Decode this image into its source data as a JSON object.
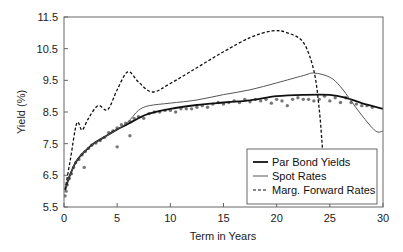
{
  "chart_data": {
    "type": "line",
    "title": "",
    "xlabel": "Term in Years",
    "ylabel": "Yield (%)",
    "xlim": [
      0,
      30
    ],
    "ylim": [
      5.5,
      11.5
    ],
    "xticks": [
      0,
      5,
      10,
      15,
      20,
      25,
      30
    ],
    "yticks": [
      5.5,
      6.5,
      7.5,
      8.5,
      9.5,
      10.5,
      11.5
    ],
    "ytick_labels": [
      "5.5",
      "6.5",
      "7.5",
      "8.5",
      "9.5",
      "10.5",
      "11.5"
    ],
    "xtick_labels": [
      "0",
      "5",
      "10",
      "15",
      "20",
      "25",
      "30"
    ],
    "grid": false,
    "legend_position": "lower right",
    "series": [
      {
        "name": "Par Bond Yields",
        "style": "solid-thick",
        "color": "#111111",
        "x": [
          0.1,
          0.5,
          1.0,
          1.5,
          2.3,
          3.0,
          4.0,
          5.0,
          6.0,
          7.0,
          8.0,
          10.0,
          12.5,
          15.0,
          17.5,
          20.0,
          22.5,
          25.0,
          26.5,
          28.0,
          30.0
        ],
        "y": [
          6.04,
          6.45,
          6.85,
          7.1,
          7.37,
          7.55,
          7.75,
          7.95,
          8.12,
          8.3,
          8.45,
          8.6,
          8.72,
          8.8,
          8.87,
          9.0,
          9.04,
          9.04,
          8.95,
          8.78,
          8.6
        ]
      },
      {
        "name": "Spot Rates",
        "style": "solid-thin",
        "color": "#555555",
        "x": [
          0.1,
          0.5,
          1.0,
          1.5,
          2.3,
          3.0,
          4.0,
          5.0,
          6.0,
          7.0,
          8.0,
          10.0,
          12.5,
          15.0,
          17.5,
          20.0,
          22.5,
          23.5,
          25.0,
          26.0,
          27.0,
          28.0,
          29.3,
          30.0
        ],
        "y": [
          6.04,
          6.45,
          6.85,
          7.1,
          7.37,
          7.55,
          7.75,
          7.95,
          8.18,
          8.55,
          8.7,
          8.78,
          8.88,
          9.05,
          9.2,
          9.42,
          9.65,
          9.73,
          9.6,
          9.3,
          8.85,
          8.4,
          7.9,
          7.9
        ]
      },
      {
        "name": "Marg. Forward Rates",
        "style": "dashed",
        "color": "#111111",
        "x": [
          0.1,
          0.6,
          1.2,
          1.7,
          2.3,
          3.2,
          4.1,
          5.0,
          6.0,
          7.0,
          8.3,
          10.0,
          12.5,
          15.0,
          17.5,
          19.6,
          21.0,
          22.5,
          23.5,
          24.0,
          24.3
        ],
        "y": [
          6.04,
          7.0,
          8.15,
          7.93,
          8.3,
          8.7,
          8.57,
          9.2,
          9.77,
          9.45,
          9.13,
          9.4,
          9.9,
          10.4,
          10.85,
          11.06,
          11.0,
          10.7,
          9.8,
          8.6,
          7.37
        ]
      },
      {
        "name": "Observed Par Yields (markers)",
        "style": "markers",
        "color": "#777777",
        "x": [
          0.1,
          0.2,
          0.3,
          0.5,
          0.7,
          0.9,
          1.1,
          1.4,
          1.7,
          2.0,
          2.3,
          2.6,
          3.0,
          3.4,
          3.8,
          4.2,
          4.6,
          5.0,
          5.4,
          5.8,
          6.2,
          6.6,
          7.0,
          7.5,
          8.0,
          8.5,
          9.0,
          9.5,
          10.0,
          10.5,
          11.0,
          11.5,
          12.0,
          12.5,
          13.0,
          13.5,
          14.0,
          14.5,
          15.0,
          15.5,
          16.0,
          16.5,
          17.0,
          17.5,
          18.0,
          18.5,
          19.0,
          19.5,
          20.0,
          20.5,
          21.0,
          21.5,
          22.0,
          22.5,
          23.0,
          23.5,
          24.0,
          24.5,
          25.0,
          25.5,
          26.0,
          26.5,
          27.0,
          27.5,
          28.0,
          28.5,
          29.0,
          1.9,
          5.0,
          6.2
        ],
        "y": [
          5.85,
          6.0,
          6.2,
          6.4,
          6.55,
          6.75,
          6.9,
          7.0,
          7.15,
          7.25,
          7.35,
          7.45,
          7.52,
          7.6,
          7.7,
          7.85,
          7.9,
          8.0,
          8.1,
          8.15,
          8.2,
          8.3,
          8.35,
          8.3,
          8.45,
          8.5,
          8.5,
          8.55,
          8.55,
          8.5,
          8.6,
          8.6,
          8.6,
          8.65,
          8.7,
          8.65,
          8.75,
          8.8,
          8.75,
          8.8,
          8.85,
          8.8,
          8.9,
          8.82,
          8.9,
          8.85,
          8.9,
          8.78,
          8.9,
          8.85,
          8.7,
          8.9,
          8.95,
          8.9,
          8.9,
          8.85,
          8.9,
          9.0,
          8.85,
          8.95,
          8.8,
          8.95,
          8.8,
          8.75,
          8.7,
          8.7,
          8.65,
          6.75,
          7.4,
          7.75
        ]
      }
    ]
  },
  "legend": {
    "items": [
      {
        "label": "Par Bond Yields",
        "style": "solid-thick"
      },
      {
        "label": "Spot Rates",
        "style": "solid-thin"
      },
      {
        "label": "Marg. Forward Rates",
        "style": "dashed"
      }
    ]
  }
}
